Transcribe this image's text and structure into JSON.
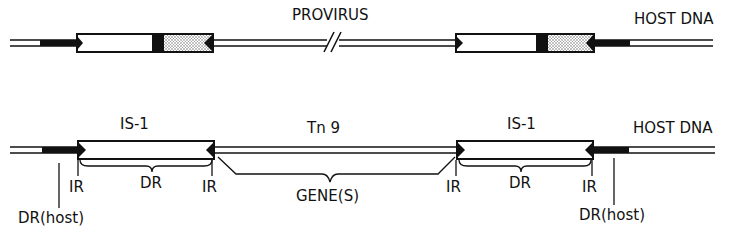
{
  "top_diagram": {
    "title": "PROVIRUS",
    "host_label": "HOST DNA"
  },
  "bottom_diagram": {
    "left_element": "IS-1",
    "middle_element": "Tn 9",
    "right_element": "IS-1",
    "host_label": "HOST DNA",
    "ir_labels": [
      "IR",
      "IR",
      "IR",
      "IR"
    ],
    "dr_labels": [
      "DR",
      "DR"
    ],
    "gene_label": "GENE(S)",
    "host_dr_labels": [
      "DR(host)",
      "DR(host)"
    ]
  },
  "colors": {
    "ink": "#111111",
    "stipple": "#9a9a9a",
    "background": "#ffffff"
  }
}
